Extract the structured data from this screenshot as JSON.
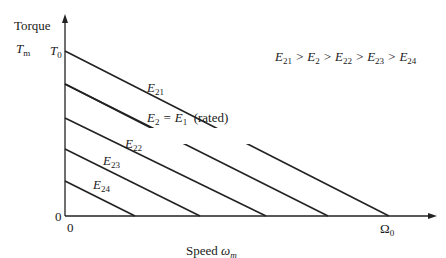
{
  "diagram": {
    "y_axis": {
      "label": "Torque",
      "symbol": "T",
      "symbol_sub": "m",
      "tick_top": "T",
      "tick_top_sub": "0",
      "origin": "0"
    },
    "x_axis": {
      "label": "Speed",
      "symbol": "ω",
      "symbol_sub": "m",
      "tick_end": "Ω",
      "tick_end_sub": "0",
      "origin": "0"
    },
    "inequality": "E21 > E2 > E22 > E23 > E24",
    "lines": [
      {
        "name": "E21",
        "label": "E",
        "sub": "21",
        "start_y_frac": 1.0,
        "end_x_frac": 1.0
      },
      {
        "name": "E2",
        "label": "E",
        "sub": "2",
        "extra": " = E",
        "extra_sub": "1",
        "note": "(rated)",
        "start_y_frac": 0.8,
        "end_x_frac": 0.8
      },
      {
        "name": "E22",
        "label": "E",
        "sub": "22",
        "start_y_frac": 0.6,
        "end_x_frac": 0.6
      },
      {
        "name": "E23",
        "label": "E",
        "sub": "23",
        "start_y_frac": 0.4,
        "end_x_frac": 0.4
      },
      {
        "name": "E24",
        "label": "E",
        "sub": "24",
        "start_y_frac": 0.2,
        "end_x_frac": 0.2
      }
    ]
  }
}
